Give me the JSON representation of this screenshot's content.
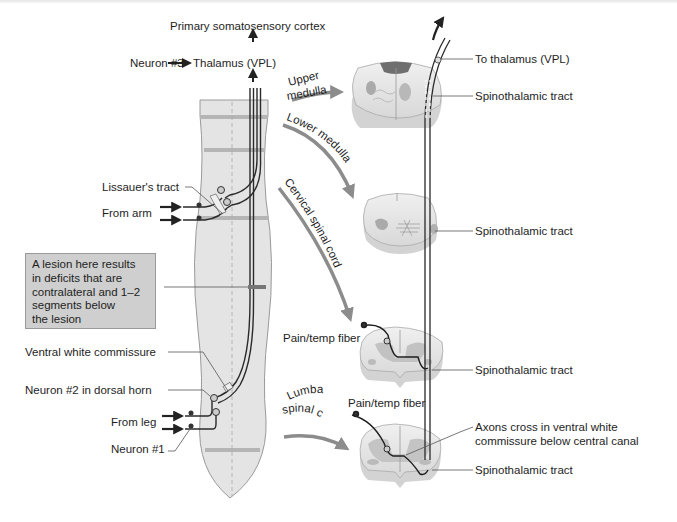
{
  "diagram": {
    "type": "anatomical-pathway",
    "colors": {
      "cord_fill": "#e4e4e4",
      "cord_outline": "#9a9a9a",
      "segment_band": "#b5b5b5",
      "fiber": "#2a2a2a",
      "grey_matter": "#bdbdbd",
      "arrow": "#8c8c8c",
      "lesion_box": "#cfcfcf"
    },
    "left_column": {
      "top_labels": {
        "cortex": "Primary somatosensory cortex",
        "neuron3": "Neuron #3",
        "thalamus": "Thalamus (VPL)"
      },
      "labels": {
        "lissauer": "Lissauer's tract",
        "from_arm": "From arm",
        "ventral_white_commissure": "Ventral white commissure",
        "neuron2": "Neuron #2 in dorsal horn",
        "from_leg": "From leg",
        "neuron1": "Neuron #1"
      },
      "lesion_box": {
        "lines": [
          "A lesion here results",
          "in deficits that are",
          "contralateral and 1–2",
          "segments below",
          "the lesion"
        ]
      }
    },
    "levels": [
      {
        "id": "upper-medulla",
        "label_line1": "Upper",
        "label_line2": "medulla",
        "tract_label": "Spinothalamic tract",
        "extra_label": "To thalamus (VPL)"
      },
      {
        "id": "lower-medulla",
        "label": "Lower medulla",
        "tract_label": "Spinothalamic tract"
      },
      {
        "id": "cervical-spinal-cord",
        "label": "Cervical spinal cord",
        "fiber_label": "Pain/temp fiber",
        "tract_label": "Spinothalamic tract"
      },
      {
        "id": "lumbar-spinal-cord",
        "label_line1": "Lumbar",
        "label_line2": "spinal cord",
        "fiber_label": "Pain/temp fiber",
        "crossing_label_line1": "Axons cross in ventral white",
        "crossing_label_line2": "commissure below central canal",
        "tract_label": "Spinothalamic tract"
      }
    ]
  }
}
